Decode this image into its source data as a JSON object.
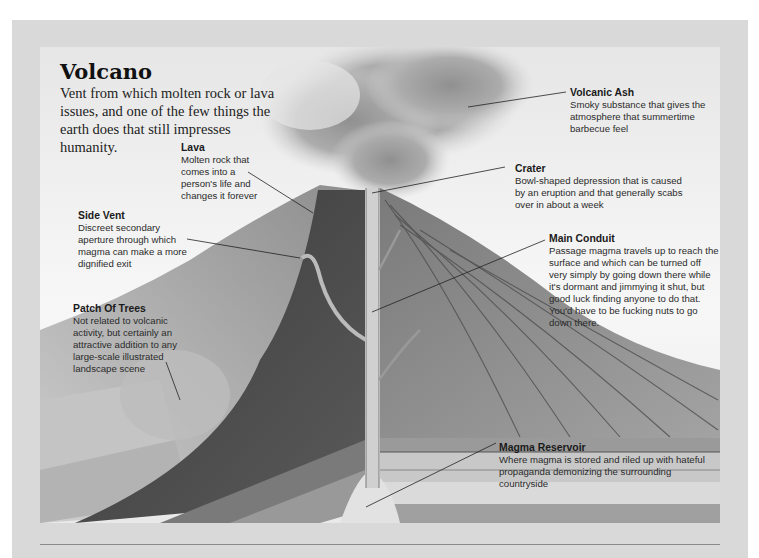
{
  "header": {
    "title": "Volcano",
    "subtitle": "Vent from which molten rock or lava issues, and one of the few things the earth does that still impresses humanity."
  },
  "labels": [
    {
      "id": "volcanic-ash",
      "heading": "Volcanic Ash",
      "text": "Smoky substance that gives the atmosphere that summertime barbecue feel"
    },
    {
      "id": "lava",
      "heading": "Lava",
      "text": "Molten rock that comes into a person's life and changes it forever"
    },
    {
      "id": "crater",
      "heading": "Crater",
      "text": "Bowl-shaped depression that is caused by an eruption and that generally scabs over in about a week"
    },
    {
      "id": "side-vent",
      "heading": "Side Vent",
      "text": "Discreet secondary aperture through which magma can make a more dignified exit"
    },
    {
      "id": "main-conduit",
      "heading": "Main Conduit",
      "text": "Passage magma travels up to reach the surface and which can be turned off very simply by going down there while it's dormant and jimmying it shut, but good luck finding anyone to do that. You'd have to be fucking nuts to go down there."
    },
    {
      "id": "patch-of-trees",
      "heading": "Patch Of Trees",
      "text": "Not related to volcanic activity, but certainly an attractive addition to any large-scale illustrated landscape scene"
    },
    {
      "id": "magma-reservoir",
      "heading": "Magma Reservoir",
      "text": "Where magma is stored and riled up with hateful propaganda demonizing the surrounding countryside"
    }
  ],
  "colors": {
    "frame": "#d9d9d9",
    "rule": "#8a8a8a",
    "leader": "#222222"
  }
}
